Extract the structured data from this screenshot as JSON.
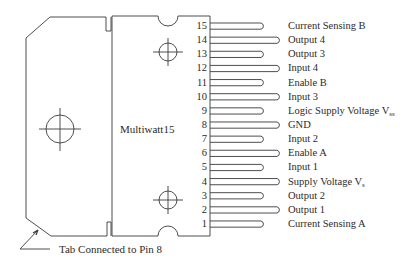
{
  "package": {
    "name": "Multiwatt15",
    "tab_note": "Tab Connected to Pin 8"
  },
  "pins": [
    {
      "number": "15",
      "label": "Current Sensing B",
      "sub": "",
      "long": false
    },
    {
      "number": "14",
      "label": "Output 4",
      "sub": "",
      "long": true
    },
    {
      "number": "13",
      "label": "Output 3",
      "sub": "",
      "long": false
    },
    {
      "number": "12",
      "label": "Input 4",
      "sub": "",
      "long": true
    },
    {
      "number": "11",
      "label": "Enable B",
      "sub": "",
      "long": false
    },
    {
      "number": "10",
      "label": "Input 3",
      "sub": "",
      "long": true
    },
    {
      "number": "9",
      "label": "Logic Supply Voltage V",
      "sub": "ss",
      "long": false
    },
    {
      "number": "8",
      "label": "GND",
      "sub": "",
      "long": true
    },
    {
      "number": "7",
      "label": "Input 2",
      "sub": "",
      "long": false
    },
    {
      "number": "6",
      "label": "Enable A",
      "sub": "",
      "long": true
    },
    {
      "number": "5",
      "label": "Input 1",
      "sub": "",
      "long": false
    },
    {
      "number": "4",
      "label": "Supply Voltage V",
      "sub": "s",
      "long": true
    },
    {
      "number": "3",
      "label": "Output 2",
      "sub": "",
      "long": false
    },
    {
      "number": "2",
      "label": "Output 1",
      "sub": "",
      "long": true
    },
    {
      "number": "1",
      "label": "Current Sensing A",
      "sub": "",
      "long": false
    }
  ],
  "colors": {
    "line": "#3a3a3a",
    "background": "#ffffff"
  }
}
